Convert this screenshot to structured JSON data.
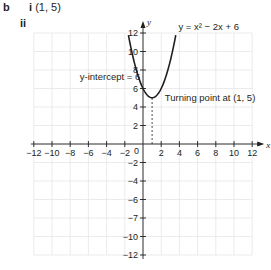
{
  "labels": {
    "part": "b",
    "sub_i_marker": "i",
    "sub_i_answer": "(1, 5)",
    "sub_ii_marker": "ii"
  },
  "annotations": {
    "equation": "y = x² − 2x + 6",
    "y_intercept": "y-intercept = 6",
    "turning_point": "Turning point at (1, 5)"
  },
  "chart_data": {
    "type": "line",
    "title": "",
    "xlabel": "x",
    "ylabel": "y",
    "xlim": [
      -12,
      12
    ],
    "ylim": [
      -12,
      12
    ],
    "grid": true,
    "x_ticks": [
      -12,
      -10,
      -8,
      -6,
      -4,
      -2,
      2,
      4,
      6,
      8,
      10,
      12
    ],
    "y_tick_labels": [
      "12",
      "10",
      "8",
      "6",
      "4",
      "2",
      "−2",
      "−4",
      "−6",
      "−7",
      "−10",
      "−12"
    ],
    "origin_label": "0",
    "series": [
      {
        "name": "y = x² − 2x + 6",
        "x": [
          -1.6,
          -1,
          0,
          1,
          2,
          3,
          3.6
        ],
        "y": [
          11.76,
          9,
          6,
          5,
          6,
          9,
          11.76
        ]
      }
    ],
    "points": [
      {
        "label": "y-intercept",
        "x": 0,
        "y": 6
      },
      {
        "label": "Turning point",
        "x": 1,
        "y": 5
      }
    ],
    "reference_lines": [
      {
        "type": "vertical",
        "x": 1,
        "from_y": 0,
        "to_y": 5,
        "style": "dashed"
      }
    ]
  }
}
